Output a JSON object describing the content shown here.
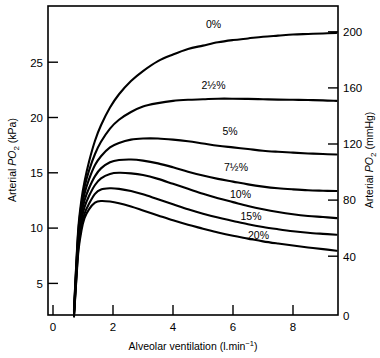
{
  "figure": {
    "title": "",
    "background_color": "#ffffff",
    "line_color": "#000000"
  },
  "chart_data": {
    "type": "line",
    "title": "",
    "subtitle": "",
    "xlabel": "Alveolar ventilation (l.min-1)",
    "xlabel_parts": {
      "main": "Alveolar ventilation (l.min",
      "sup": "−1",
      "tail": ")"
    },
    "ylabel": "Arterial PO2 (kPa)",
    "ylabel_parts": {
      "pre": "Arterial ",
      "sym": "P",
      "sub": "O",
      "sub2": "2",
      "post": " (kPa)"
    },
    "ylabel_right": "Arterial PO2 (mmHg)",
    "ylabel_right_parts": {
      "pre": "Arterial ",
      "sym": "P",
      "sub": "O",
      "sub2": "2",
      "post": " (mmHg)"
    },
    "xlim": [
      0,
      9.5
    ],
    "ylim": [
      0,
      29.3
    ],
    "ylim_right": [
      0,
      220
    ],
    "grid": false,
    "legend": "inline-labels",
    "xticks": [
      0,
      2,
      4,
      6,
      8
    ],
    "xtick_labels": [
      "0",
      "2",
      "4",
      "6",
      "8"
    ],
    "yticks": [
      5,
      10,
      15,
      20,
      25
    ],
    "ytick_labels": [
      "5",
      "10",
      "15",
      "20",
      "25"
    ],
    "yticks_right": [
      0,
      40,
      80,
      120,
      160,
      200
    ],
    "ytick_labels_right": [
      "0",
      "40",
      "80",
      "120",
      "160",
      "200"
    ],
    "units_note": "right axis mmHg = kPa x 7.5",
    "series": [
      {
        "name": "0%",
        "label": "0%",
        "label_x": 5.35,
        "label_y": 28.1,
        "x": [
          0.7,
          0.78,
          0.85,
          0.95,
          1.05,
          1.2,
          1.4,
          1.6,
          1.9,
          2.2,
          2.6,
          3.0,
          3.5,
          4.0,
          4.5,
          5.0,
          5.5,
          6.0,
          6.5,
          7.0,
          7.5,
          8.0,
          8.5,
          9.0,
          9.45
        ],
        "y": [
          2.6,
          7.0,
          10.2,
          12.6,
          14.2,
          16.0,
          17.9,
          19.3,
          20.9,
          22.1,
          23.3,
          24.2,
          25.1,
          25.7,
          26.2,
          26.5,
          26.8,
          27.0,
          27.15,
          27.3,
          27.4,
          27.5,
          27.55,
          27.6,
          27.65
        ]
      },
      {
        "name": "2.5%",
        "label": "2½%",
        "label_x": 5.35,
        "label_y": 22.6,
        "x": [
          0.7,
          0.78,
          0.85,
          0.95,
          1.05,
          1.2,
          1.4,
          1.6,
          1.9,
          2.2,
          2.6,
          3.0,
          3.5,
          4.0,
          4.5,
          5.0,
          5.5,
          6.0,
          6.5,
          7.0,
          7.5,
          8.0,
          8.5,
          9.0,
          9.45
        ],
        "y": [
          2.5,
          6.8,
          9.9,
          12.2,
          13.7,
          15.2,
          16.7,
          17.8,
          19.0,
          19.8,
          20.5,
          21.0,
          21.3,
          21.5,
          21.6,
          21.65,
          21.7,
          21.7,
          21.68,
          21.65,
          21.62,
          21.6,
          21.58,
          21.55,
          21.5
        ]
      },
      {
        "name": "5%",
        "label": "5%",
        "label_x": 5.9,
        "label_y": 18.4,
        "x": [
          0.7,
          0.78,
          0.85,
          0.95,
          1.05,
          1.2,
          1.4,
          1.6,
          1.9,
          2.2,
          2.6,
          3.0,
          3.5,
          4.0,
          4.5,
          5.0,
          5.5,
          6.0,
          6.5,
          7.0,
          7.5,
          8.0,
          8.5,
          9.0,
          9.45
        ],
        "y": [
          2.4,
          6.5,
          9.5,
          11.7,
          13.1,
          14.4,
          15.7,
          16.5,
          17.3,
          17.7,
          18.0,
          18.1,
          18.1,
          18.0,
          17.85,
          17.65,
          17.45,
          17.3,
          17.15,
          17.0,
          16.9,
          16.82,
          16.75,
          16.7,
          16.65
        ]
      },
      {
        "name": "7.5%",
        "label": "7½%",
        "label_x": 6.1,
        "label_y": 15.2,
        "x": [
          0.7,
          0.78,
          0.85,
          0.95,
          1.05,
          1.2,
          1.4,
          1.6,
          1.9,
          2.2,
          2.6,
          3.0,
          3.5,
          4.0,
          4.5,
          5.0,
          5.5,
          6.0,
          6.5,
          7.0,
          7.5,
          8.0,
          8.5,
          9.0,
          9.45
        ],
        "y": [
          2.3,
          6.2,
          9.1,
          11.2,
          12.5,
          13.6,
          14.7,
          15.4,
          15.95,
          16.15,
          16.2,
          16.1,
          15.85,
          15.5,
          15.1,
          14.75,
          14.45,
          14.2,
          13.95,
          13.75,
          13.6,
          13.5,
          13.42,
          13.38,
          13.35
        ]
      },
      {
        "name": "10%",
        "label": "10%",
        "label_x": 6.25,
        "label_y": 12.7,
        "x": [
          0.7,
          0.78,
          0.85,
          0.95,
          1.05,
          1.2,
          1.4,
          1.6,
          1.9,
          2.2,
          2.6,
          3.0,
          3.5,
          4.0,
          4.5,
          5.0,
          5.5,
          6.0,
          6.5,
          7.0,
          7.5,
          8.0,
          8.5,
          9.0,
          9.45
        ],
        "y": [
          2.2,
          5.9,
          8.7,
          10.7,
          11.9,
          12.9,
          13.9,
          14.5,
          14.9,
          15.0,
          14.95,
          14.8,
          14.45,
          14.0,
          13.55,
          13.1,
          12.7,
          12.35,
          12.0,
          11.7,
          11.45,
          11.25,
          11.1,
          11.0,
          10.9
        ]
      },
      {
        "name": "15%",
        "label": "15%",
        "label_x": 6.6,
        "label_y": 10.7,
        "x": [
          0.7,
          0.78,
          0.85,
          0.95,
          1.05,
          1.2,
          1.4,
          1.6,
          1.9,
          2.2,
          2.6,
          3.0,
          3.5,
          4.0,
          4.5,
          5.0,
          5.5,
          6.0,
          6.5,
          7.0,
          7.5,
          8.0,
          8.5,
          9.0,
          9.45
        ],
        "y": [
          2.1,
          5.6,
          8.3,
          10.2,
          11.3,
          12.2,
          13.1,
          13.5,
          13.6,
          13.55,
          13.35,
          13.05,
          12.6,
          12.15,
          11.7,
          11.3,
          10.95,
          10.65,
          10.35,
          10.1,
          9.9,
          9.72,
          9.58,
          9.48,
          9.4
        ]
      },
      {
        "name": "20%",
        "label": "20%",
        "label_x": 6.85,
        "label_y": 9.0,
        "x": [
          0.7,
          0.78,
          0.85,
          0.95,
          1.05,
          1.2,
          1.4,
          1.6,
          1.9,
          2.2,
          2.6,
          3.0,
          3.5,
          4.0,
          4.5,
          5.0,
          5.5,
          6.0,
          6.5,
          7.0,
          7.5,
          8.0,
          8.5,
          9.0,
          9.45
        ],
        "y": [
          2.0,
          5.4,
          8.0,
          9.8,
          10.9,
          11.7,
          12.3,
          12.45,
          12.4,
          12.25,
          11.95,
          11.6,
          11.15,
          10.7,
          10.3,
          9.95,
          9.6,
          9.3,
          9.05,
          8.8,
          8.6,
          8.42,
          8.25,
          8.1,
          7.95
        ]
      }
    ]
  }
}
